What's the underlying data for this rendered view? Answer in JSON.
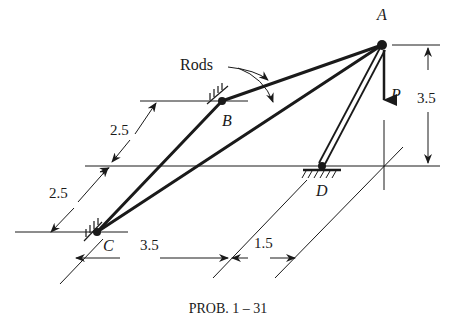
{
  "figure": {
    "caption": "PROB. 1 – 31",
    "points": {
      "A": "A",
      "B": "B",
      "C": "C",
      "D": "D"
    },
    "load_label": "P",
    "rods_label": "Rods",
    "dimensions": {
      "height_A": "3.5",
      "upper_slant": "2.5",
      "lower_slant": "2.5",
      "bottom_left": "3.5",
      "bottom_right": "1.5"
    },
    "colors": {
      "ink": "#1a1a1a",
      "background": "#ffffff"
    }
  }
}
